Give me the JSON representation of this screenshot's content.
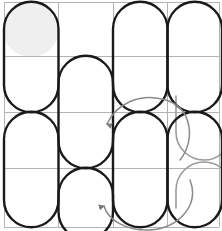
{
  "figure": {
    "title": "",
    "width": 222,
    "height": 231,
    "background_color": "#ffffff"
  },
  "grid": {
    "name": "4x4-lattice",
    "rows": 4,
    "cols": 4,
    "x_lines": [
      4,
      58.5,
      113,
      167.5,
      219
    ],
    "y_lines": [
      2,
      56,
      112,
      168,
      227
    ],
    "line_color": "#b3b3b3",
    "line_width": 1
  },
  "colors": {
    "stroke_dark": "#1a1a1a",
    "stroke_ghost": "#9b9b9b",
    "fill_highlight": "#efefef",
    "grid": "#b3b3b3"
  },
  "capsules": {
    "stroke_width": 2.4,
    "note": "vertical stadium outlines spanning two grid rows",
    "items": [
      {
        "name": "capsule-c0-r0r1",
        "col": 0,
        "row_start": 0,
        "row_end": 1
      },
      {
        "name": "capsule-c1-r1r2",
        "col": 1,
        "row_start": 1,
        "row_end": 2
      },
      {
        "name": "capsule-c1-r3r4",
        "col": 1,
        "row_start": 3,
        "row_end": 4
      },
      {
        "name": "capsule-c2-r0r1",
        "col": 2,
        "row_start": 0,
        "row_end": 1
      },
      {
        "name": "capsule-c2-r2r3",
        "col": 2,
        "row_start": 2,
        "row_end": 3
      },
      {
        "name": "capsule-c0-r2r3",
        "col": 0,
        "row_start": 2,
        "row_end": 3
      },
      {
        "name": "capsule-c3-r0r1",
        "col": 3,
        "row_start": 0,
        "row_end": 1
      },
      {
        "name": "capsule-c3-r2r3",
        "col": 3,
        "row_start": 2,
        "row_end": 3
      }
    ]
  },
  "highlight": {
    "name": "filled-circle-top-left",
    "cx": 31,
    "cy": 29,
    "r": 27,
    "fill": "#efefef"
  },
  "ghost_arcs": [
    {
      "name": "ghost-arc-right-upper",
      "description": "faint grey u-turn arc in column 3 upper-middle"
    },
    {
      "name": "ghost-arc-right-lower",
      "description": "faint grey u-turn arc in column 3 lower"
    }
  ],
  "arrows": [
    {
      "name": "rotation-arrow-upper",
      "direction": "down",
      "color": "#7a7a7a",
      "description": "curved grey arrow sweeping counter-clockwise ending with arrowhead pointing down near column 2 row 2"
    },
    {
      "name": "rotation-arrow-lower",
      "direction": "up",
      "color": "#7a7a7a",
      "description": "curved grey arrow sweeping counter-clockwise ending with arrowhead pointing up near column 2 row 3"
    }
  ],
  "labels": []
}
